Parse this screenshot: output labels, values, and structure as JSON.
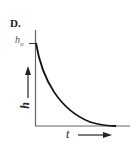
{
  "figure": {
    "panel_label": "D.",
    "y_tick_label": "h",
    "y_tick_subscript": "o",
    "y_axis_label": "h",
    "x_axis_label": "t"
  },
  "colors": {
    "axis": "#666666",
    "curve": "#111111",
    "text": "#222222"
  }
}
